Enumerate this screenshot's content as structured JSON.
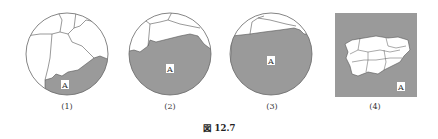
{
  "figure": {
    "caption": "図 12.7",
    "panels": [
      {
        "label": "(1)",
        "region_label": "A"
      },
      {
        "label": "(2)",
        "region_label": "A"
      },
      {
        "label": "(3)",
        "region_label": "A"
      },
      {
        "label": "(4)",
        "region_label": "A"
      }
    ]
  },
  "colors": {
    "shade": "#9a9a9a",
    "outline": "#555555",
    "background": "#ffffff"
  }
}
